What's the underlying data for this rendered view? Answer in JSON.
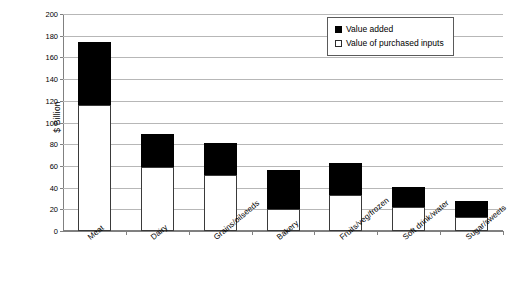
{
  "chart_data": {
    "type": "bar",
    "title": "",
    "subtitle": "",
    "xlabel": "",
    "ylabel": "$ Billion",
    "ylim": [
      0,
      200
    ],
    "yticks": [
      0,
      20,
      40,
      60,
      80,
      100,
      120,
      140,
      160,
      180,
      200
    ],
    "grid": true,
    "stacked": true,
    "legend_position": "top-right",
    "categories": [
      "Meat",
      "Dairy",
      "Grains/oilseeds",
      "Bakery",
      "Fruits/veg/frozen",
      "Soft drink/water",
      "Sugar/sweets"
    ],
    "series": [
      {
        "name": "Value of purchased inputs",
        "color": "#ffffff",
        "values": [
          116,
          59,
          52,
          20,
          33,
          22,
          13
        ]
      },
      {
        "name": "Value added",
        "color": "#000000",
        "values": [
          58,
          30,
          29,
          36,
          30,
          19,
          15
        ]
      }
    ],
    "totals": [
      174,
      89,
      81,
      56,
      63,
      41,
      28
    ]
  },
  "axes": {
    "y_title": "$ Billion",
    "y_tick_labels": [
      "0",
      "20",
      "40",
      "60",
      "80",
      "100",
      "120",
      "140",
      "160",
      "180",
      "200"
    ],
    "x_tick_labels": [
      "Meat",
      "Dairy",
      "Grains/oilseeds",
      "Bakery",
      "Fruits/veg/frozen",
      "Soft drink/water",
      "Sugar/sweets"
    ]
  },
  "legend": {
    "items": [
      {
        "label": "Value added",
        "swatch": "filled-black-square"
      },
      {
        "label": "Value of purchased inputs",
        "swatch": "hollow-white-square"
      }
    ]
  },
  "colors": {
    "value_added": "#000000",
    "value_purchased": "#ffffff",
    "gridline": "#b7b7b7",
    "axis": "#808080",
    "background": "#ffffff"
  }
}
